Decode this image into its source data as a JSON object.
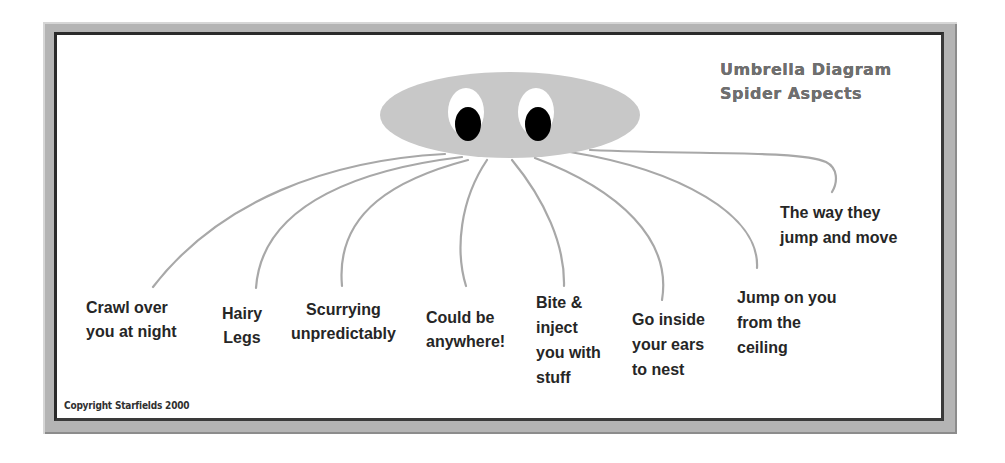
{
  "diagram": {
    "title_line1": "Umbrella Diagram",
    "title_line2": "Spider Aspects",
    "copyright": "Copyright Starfields 2000",
    "colors": {
      "body": "#c8c8c8",
      "legs": "#a8a8a8",
      "eye_white": "#ffffff",
      "pupil": "#000000",
      "title_text": "#6f6f6f",
      "label_text": "#262626",
      "frame_dark": "#2a2a2a",
      "frame_light": "#b4b4b4"
    },
    "aspects": [
      {
        "line1": "Crawl over",
        "line2": "you at night"
      },
      {
        "line1": "Hairy",
        "line2": "Legs"
      },
      {
        "line1": "Scurrying",
        "line2": "unpredictably"
      },
      {
        "line1": "Could be",
        "line2": "anywhere!"
      },
      {
        "line1": "Bite &",
        "line2": "inject",
        "line3": "you with",
        "line4": "stuff"
      },
      {
        "line1": "Go inside",
        "line2": "your ears",
        "line3": "to nest"
      },
      {
        "line1": "Jump on you",
        "line2": "from the",
        "line3": "ceiling"
      },
      {
        "line1": "The way they",
        "line2": "jump and move"
      }
    ]
  }
}
